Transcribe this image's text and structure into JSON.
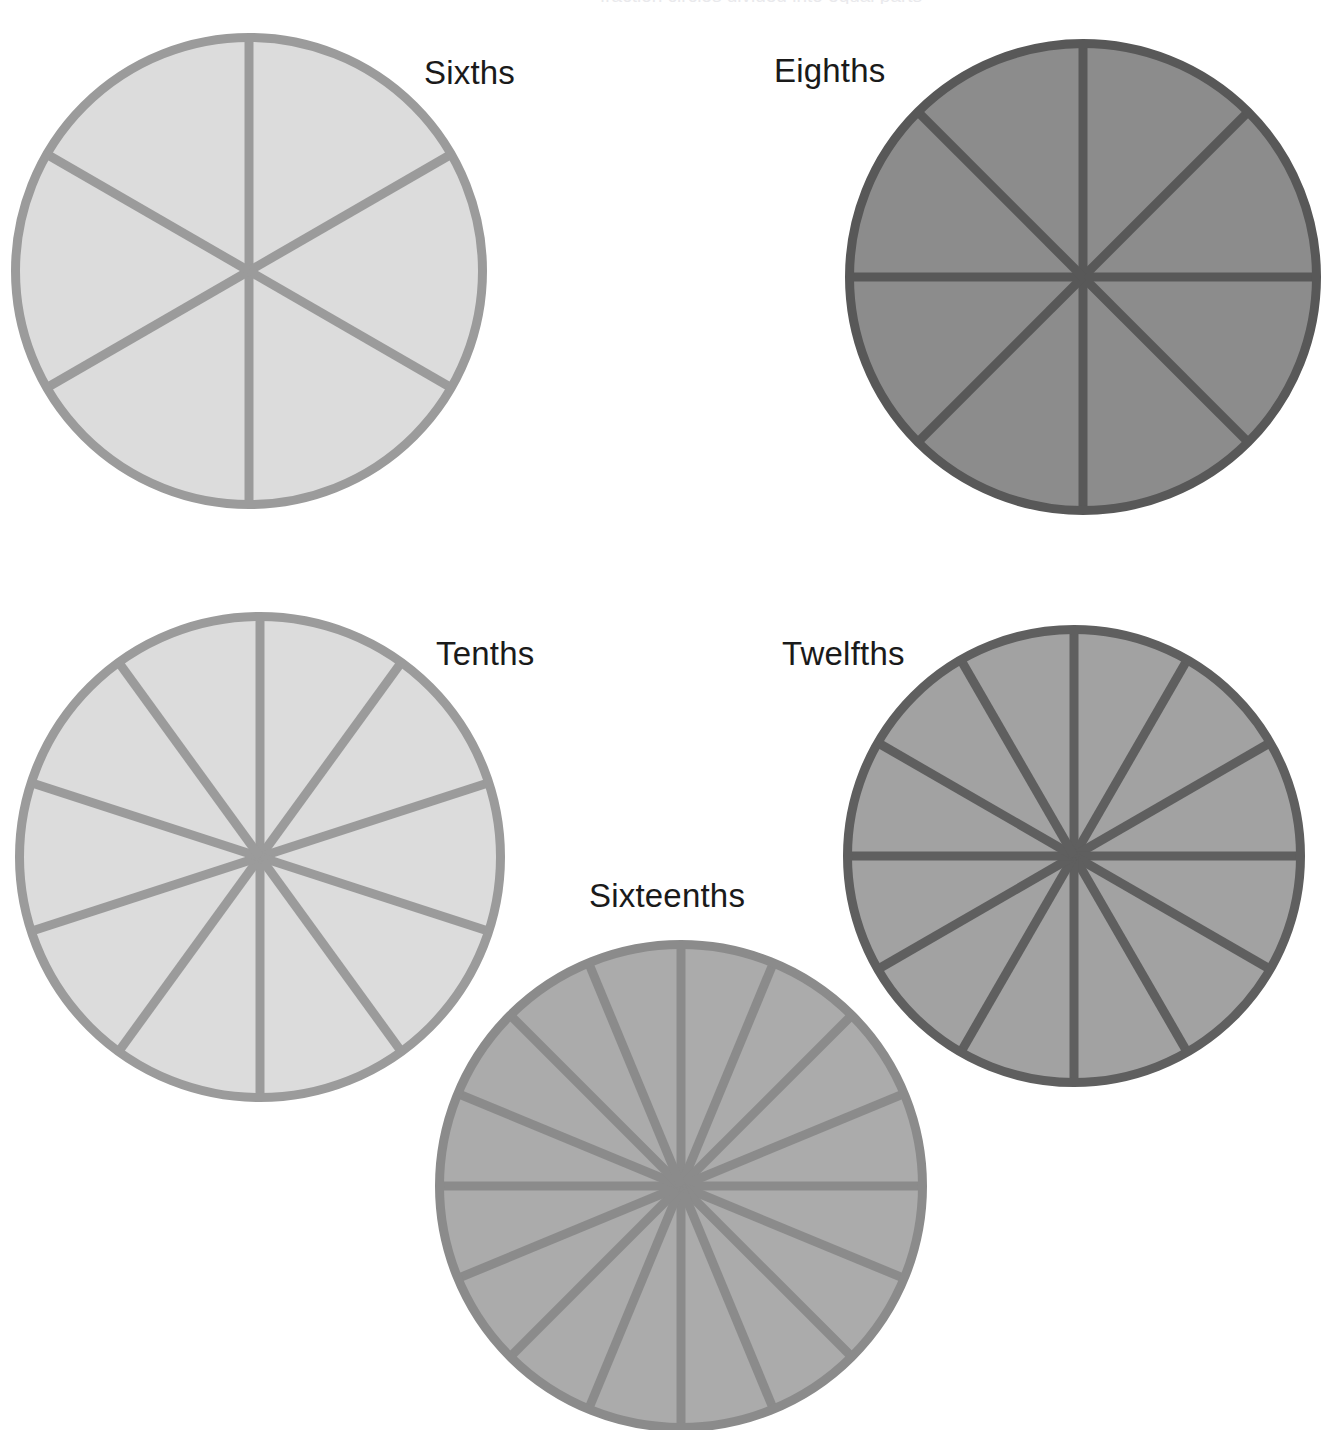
{
  "page": {
    "title": "Fraction Circles",
    "background_color": "#ffffff",
    "width": 1321,
    "height": 1430,
    "top_clipped_caption": "fraction circles divided into equal parts"
  },
  "labels": {
    "sixths": "Sixths",
    "eighths": "Eighths",
    "tenths": "Tenths",
    "twelfths": "Twelfths",
    "sixteenths": "Sixteenths"
  },
  "palette": {
    "sixths_fill": "#DCDCDC",
    "sixths_stroke": "#9B9B9B",
    "eighths_fill": "#8C8C8C",
    "eighths_stroke": "#585858",
    "tenths_fill": "#DCDCDC",
    "tenths_stroke": "#9B9B9B",
    "twelfths_fill": "#A2A2A2",
    "twelfths_stroke": "#5F5F5F",
    "sixteenths_fill": "#ABABAB",
    "sixteenths_stroke": "#8B8B8B",
    "label_color": "#1a1a1a"
  },
  "chart_data": {
    "type": "pie",
    "title": "Fraction Circles",
    "legend": "none",
    "grid": false,
    "charts": [
      {
        "name": "sixths",
        "title": "Sixths",
        "slices": 6,
        "slice_value": "1/6",
        "values": [
          1,
          1,
          1,
          1,
          1,
          1
        ],
        "center": [
          249,
          271
        ],
        "radius": 238,
        "start_angle_deg": -90,
        "fill": "#DCDCDC",
        "stroke": "#9B9B9B",
        "stroke_width": 9,
        "label_position": "right"
      },
      {
        "name": "eighths",
        "title": "Eighths",
        "slices": 8,
        "slice_value": "1/8",
        "values": [
          1,
          1,
          1,
          1,
          1,
          1,
          1,
          1
        ],
        "center": [
          1083,
          277
        ],
        "radius": 238,
        "start_angle_deg": -90,
        "fill": "#8C8C8C",
        "stroke": "#585858",
        "stroke_width": 9,
        "label_position": "left"
      },
      {
        "name": "tenths",
        "title": "Tenths",
        "slices": 10,
        "slice_value": "1/10",
        "values": [
          1,
          1,
          1,
          1,
          1,
          1,
          1,
          1,
          1,
          1
        ],
        "center": [
          260,
          857
        ],
        "radius": 245,
        "start_angle_deg": -90,
        "fill": "#DCDCDC",
        "stroke": "#9B9B9B",
        "stroke_width": 9,
        "label_position": "right"
      },
      {
        "name": "twelfths",
        "title": "Twelfths",
        "slices": 12,
        "slice_value": "1/12",
        "values": [
          1,
          1,
          1,
          1,
          1,
          1,
          1,
          1,
          1,
          1,
          1,
          1
        ],
        "center": [
          1074,
          856
        ],
        "radius": 231,
        "start_angle_deg": -90,
        "fill": "#A2A2A2",
        "stroke": "#5F5F5F",
        "stroke_width": 9,
        "label_position": "left"
      },
      {
        "name": "sixteenths",
        "title": "Sixteenths",
        "slices": 16,
        "slice_value": "1/16",
        "values": [
          1,
          1,
          1,
          1,
          1,
          1,
          1,
          1,
          1,
          1,
          1,
          1,
          1,
          1,
          1,
          1
        ],
        "center": [
          681,
          1186
        ],
        "radius": 246,
        "start_angle_deg": -90,
        "fill": "#ABABAB",
        "stroke": "#8B8B8B",
        "stroke_width": 9,
        "label_position": "above"
      }
    ]
  },
  "label_positions": {
    "sixths": {
      "left": 424,
      "top": 56
    },
    "eighths": {
      "left": 774,
      "top": 54
    },
    "tenths": {
      "left": 436,
      "top": 637
    },
    "twelfths": {
      "left": 782,
      "top": 637
    },
    "sixteenths": {
      "left": 589,
      "top": 879
    }
  }
}
